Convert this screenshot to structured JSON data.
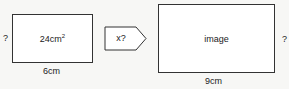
{
  "original": {
    "area_value": "24cm",
    "area_exponent": "2",
    "unknown_side": "?",
    "bottom_side": "6cm"
  },
  "transform": {
    "label": "x?"
  },
  "image": {
    "label": "image",
    "unknown_side": "?",
    "bottom_side": "9cm"
  }
}
